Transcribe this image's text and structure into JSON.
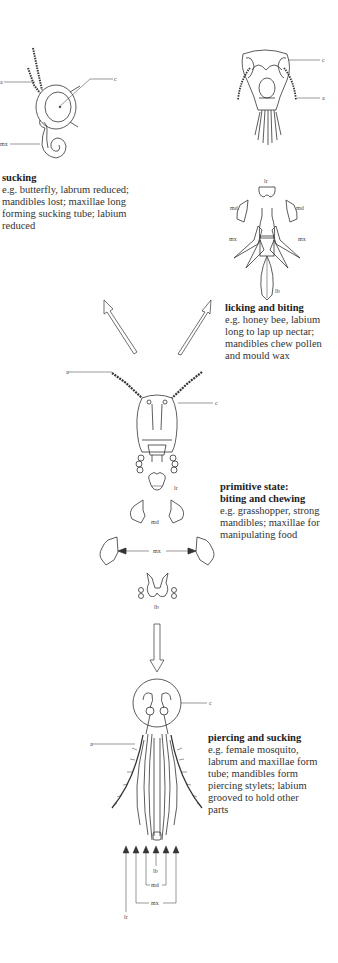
{
  "panels": [
    {
      "id": "sucking",
      "title": "sucking",
      "body": "e.g. butterfly, labrum reduced; mandibles lost; maxillae long forming sucking tube; labium reduced",
      "labels": {
        "a": "a",
        "c": "c",
        "mx": "mx"
      }
    },
    {
      "id": "licking",
      "title": "licking and biting",
      "body": "e.g. honey bee, labium long to lap up nectar; mandibles chew pollen and mould wax",
      "labels": {
        "c": "c",
        "a": "a",
        "lr": "lr",
        "md_left": "md",
        "md_right": "md",
        "mx_left": "mx",
        "mx_right": "mx",
        "lb": "lb"
      }
    },
    {
      "id": "primitive",
      "title_line1": "primitive state:",
      "title_line2": "biting and chewing",
      "body": "e.g. grasshopper, strong mandibles; maxillae for manipulating food",
      "labels": {
        "a": "a",
        "c": "c",
        "lr": "lr",
        "md": "md",
        "mx": "mx",
        "lb": "lb"
      }
    },
    {
      "id": "piercing",
      "title": "piercing and sucking",
      "body": "e.g. female mosquito, labrum and maxillae form tube; mandibles form piercing stylets; labium grooved to hold other parts",
      "labels": {
        "c": "c",
        "a": "a",
        "lb": "lb",
        "md": "md",
        "mx": "mx",
        "lr": "lr"
      }
    }
  ],
  "colors": {
    "line": "#333333",
    "text": "#2a2a2a",
    "background": "#ffffff"
  }
}
